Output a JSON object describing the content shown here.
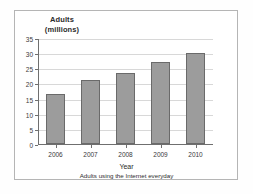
{
  "chart_data": {
    "type": "bar",
    "title": "",
    "categories": [
      "2006",
      "2007",
      "2008",
      "2009",
      "2010"
    ],
    "values": [
      16.5,
      21.2,
      23.5,
      27.2,
      30.0
    ],
    "series": [
      {
        "name": "Adults using the Internet everyday",
        "values": [
          16.5,
          21.2,
          23.5,
          27.2,
          30.0
        ]
      }
    ],
    "xlabel": "Year",
    "ylabel": "Adults (millions)",
    "ylabel_line1": "Adults",
    "ylabel_line2": "(millions)",
    "caption": "Adults using the Internet everyday",
    "ylim": [
      0,
      35
    ],
    "yticks": [
      0,
      5,
      10,
      15,
      20,
      25,
      30,
      35
    ],
    "ytick_labels": [
      "0",
      "5",
      "10",
      "15",
      "20",
      "25",
      "30",
      "35"
    ],
    "grid": true,
    "legend": false,
    "bar_color": "#9c9c9c",
    "bar_border_color": "#6a6a6a",
    "grid_color": "#d8d8d8",
    "axis_color": "#6f6f6f",
    "frame_color": "#b5b5b5",
    "background": "#ffffff"
  }
}
